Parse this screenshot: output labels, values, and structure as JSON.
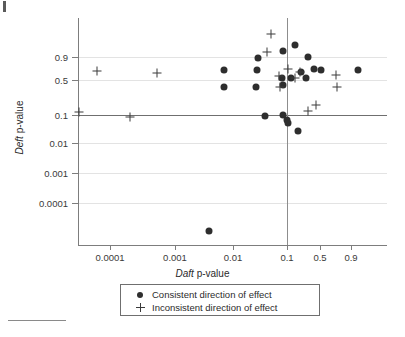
{
  "figure": {
    "bottom_rule": "",
    "corner_mark": ""
  },
  "chart_data": {
    "type": "scatter",
    "title": "",
    "xlabel_italic": "Daft",
    "xlabel_rest": " p-value",
    "ylabel_italic": "Deft",
    "ylabel_rest": " p-value",
    "x_scale": "logit-like p-value scale",
    "y_scale": "logit-like p-value scale",
    "xticks": [
      "0.0001",
      "0.001",
      "0.01",
      "0.1",
      "0.5",
      "0.9"
    ],
    "xtick_px": [
      110,
      175,
      233,
      287,
      320,
      351
    ],
    "yticks": [
      "0.9",
      "0.5",
      "0.1",
      "0.01",
      "0.001",
      "0.0001"
    ],
    "ytick_px": [
      57,
      80,
      115,
      143,
      173,
      203
    ],
    "gridlines": true,
    "reference_lines": {
      "horizontal_at": "0.1",
      "horizontal_px": 115,
      "vertical_at": "0.1",
      "vertical_px": 287
    },
    "series": [
      {
        "name": "Consistent direction of effect",
        "marker": "dot",
        "color": "#2e2e2e",
        "points_px": [
          [
            258,
            58
          ],
          [
            283,
            51
          ],
          [
            295,
            45
          ],
          [
            308,
            57
          ],
          [
            314,
            69
          ],
          [
            321,
            70
          ],
          [
            301,
            72
          ],
          [
            291,
            78
          ],
          [
            306,
            78
          ],
          [
            282,
            78
          ],
          [
            224,
            70
          ],
          [
            224,
            87
          ],
          [
            257,
            70
          ],
          [
            256,
            87
          ],
          [
            283,
            85
          ],
          [
            358,
            70
          ],
          [
            265,
            116
          ],
          [
            283,
            115
          ],
          [
            287,
            120
          ],
          [
            288,
            123
          ],
          [
            298,
            131
          ],
          [
            209,
            231
          ]
        ],
        "points_data": [
          [
            0.12,
            0.92
          ],
          [
            0.3,
            0.97
          ],
          [
            0.38,
            1.05
          ],
          [
            0.5,
            0.9
          ],
          [
            0.58,
            0.72
          ],
          [
            0.63,
            0.71
          ],
          [
            0.44,
            0.7
          ],
          [
            0.36,
            0.55
          ],
          [
            0.52,
            0.55
          ],
          [
            0.28,
            0.55
          ],
          [
            0.04,
            0.62
          ],
          [
            0.04,
            0.35
          ],
          [
            0.1,
            0.65
          ],
          [
            0.1,
            0.35
          ],
          [
            0.3,
            0.45
          ],
          [
            0.99,
            0.62
          ],
          [
            0.18,
            0.08
          ],
          [
            0.3,
            0.1
          ],
          [
            0.33,
            0.07
          ],
          [
            0.34,
            0.06
          ],
          [
            0.44,
            0.02
          ],
          [
            0.025,
            5e-06
          ]
        ]
      },
      {
        "name": "Inconsistent direction of effect",
        "marker": "plus",
        "color": "#3a3a3a",
        "points_px": [
          [
            271,
            34
          ],
          [
            267,
            52
          ],
          [
            288,
            69
          ],
          [
            300,
            72
          ],
          [
            279,
            76
          ],
          [
            295,
            78
          ],
          [
            280,
            87
          ],
          [
            336,
            75
          ],
          [
            337,
            87
          ],
          [
            316,
            105
          ],
          [
            308,
            111
          ],
          [
            97,
            71
          ],
          [
            157,
            73
          ],
          [
            79,
            112
          ],
          [
            130,
            117
          ]
        ],
        "points_data": [
          [
            0.24,
            1.2
          ],
          [
            0.22,
            0.95
          ],
          [
            0.33,
            0.72
          ],
          [
            0.42,
            0.7
          ],
          [
            0.27,
            0.62
          ],
          [
            0.38,
            0.58
          ],
          [
            0.28,
            0.35
          ],
          [
            0.8,
            0.55
          ],
          [
            0.81,
            0.35
          ],
          [
            0.68,
            0.15
          ],
          [
            0.58,
            0.12
          ],
          [
            8e-05,
            0.62
          ],
          [
            0.0016,
            0.58
          ],
          [
            9e-05,
            0.1
          ],
          [
            0.0004,
            0.085
          ]
        ]
      }
    ],
    "legend": {
      "position": "below-plot",
      "entries": [
        {
          "symbol": "dot",
          "label": "Consistent direction of effect"
        },
        {
          "symbol": "plus",
          "label": "Inconsistent direction of effect"
        }
      ]
    }
  }
}
